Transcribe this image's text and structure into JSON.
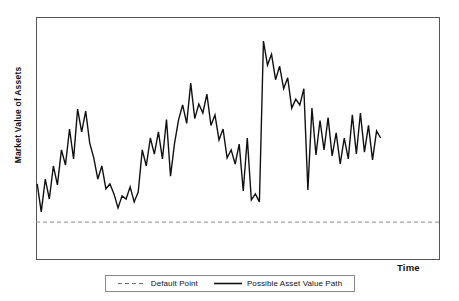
{
  "chart_data": {
    "type": "line",
    "title": "",
    "xlabel": "Time",
    "ylabel": "Market Value of Assets",
    "grid": false,
    "legend_position": "bottom-center",
    "axis_ticks": {
      "x": [],
      "y": []
    },
    "xlim": [
      0,
      100
    ],
    "ylim": [
      0,
      100
    ],
    "annotations": [],
    "series": [
      {
        "name": "Default Point",
        "style": "dashed",
        "color": "#8a8a8a",
        "type": "threshold-line",
        "value": 15.6,
        "x": [
          0,
          100
        ],
        "values": [
          15.6,
          15.6
        ]
      },
      {
        "name": "Possible Asset Value Path",
        "style": "solid",
        "color": "#111111",
        "type": "line",
        "x": [
          0.3,
          1.3,
          2.3,
          3.3,
          4.3,
          5.3,
          6.3,
          7.3,
          8.3,
          9.3,
          10.3,
          11.3,
          12.3,
          13.3,
          14.3,
          15.3,
          16.3,
          17.3,
          18.3,
          19.3,
          20.3,
          21.3,
          22.3,
          23.3,
          24.3,
          25.3,
          26.3,
          27.3,
          28.3,
          29.3,
          30.3,
          31.3,
          32.3,
          33.3,
          34.3,
          35.3,
          36.3,
          37.3,
          38.3,
          39.3,
          40.3,
          41.3,
          42.3,
          43.3,
          44.3,
          45.3,
          46.3,
          47.3,
          48.3,
          49.3,
          50.3,
          51.3,
          52.3,
          53.3,
          54.3,
          55.3,
          56.3,
          57.3,
          58.3,
          59.3,
          60.3,
          61.3,
          62.3,
          63.3,
          64.3,
          65.3,
          66.3,
          67.3,
          68.3,
          69.3,
          70.3,
          71.3,
          72.3,
          73.3,
          74.3,
          75.3,
          76.3,
          77.3,
          78.3,
          79.3,
          80.3,
          81.3,
          82.3,
          83.3,
          84.3,
          85.3
        ],
        "values": [
          31.3,
          19.8,
          33.3,
          25.1,
          38.7,
          30.9,
          45.3,
          39.1,
          53.9,
          41.6,
          62.1,
          52.7,
          61.3,
          48.1,
          42.0,
          33.3,
          38.7,
          29.3,
          31.3,
          27.2,
          21.4,
          26.4,
          25.1,
          30.1,
          23.9,
          28.0,
          45.3,
          38.7,
          50.2,
          43.6,
          52.7,
          41.6,
          57.8,
          34.5,
          48.1,
          57.8,
          63.8,
          56.2,
          72.8,
          58.2,
          64.2,
          60.5,
          68.3,
          55.4,
          59.7,
          49.4,
          53.9,
          42.0,
          45.3,
          39.5,
          47.7,
          28.4,
          50.2,
          24.7,
          27.2,
          23.9,
          90.1,
          80.2,
          84.7,
          74.2,
          79.8,
          70.5,
          75.0,
          62.5,
          66.2,
          63.8,
          70.5,
          28.8,
          62.5,
          43.2,
          57.4,
          45.3,
          58.6,
          42.8,
          52.3,
          39.5,
          50.2,
          41.6,
          59.7,
          43.6,
          60.5,
          44.4,
          55.4,
          41.2,
          53.1,
          50.2
        ]
      }
    ]
  },
  "legend": {
    "entries": [
      {
        "label": "Default Point",
        "marker": "dashed-line-swatch"
      },
      {
        "label": "Possible Asset Value Path",
        "marker": "solid-line-swatch"
      }
    ]
  }
}
